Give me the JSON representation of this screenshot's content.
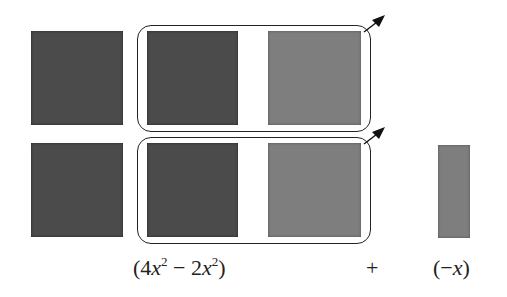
{
  "diagram": {
    "rows": [
      {
        "tiles": [
          "x2-dark",
          "x2-dark",
          "x2-light"
        ],
        "grouped": [
          "x2-dark",
          "x2-light"
        ]
      },
      {
        "tiles": [
          "x2-dark",
          "x2-dark",
          "x2-light",
          "x-light"
        ],
        "grouped": [
          "x2-dark",
          "x2-light"
        ]
      }
    ],
    "colors": {
      "dark_tile": "#4b4b4b",
      "light_tile": "#7e7e7e",
      "outline": "#222222"
    },
    "labels": {
      "term1_open": "(4",
      "term1_var1": "x",
      "term1_exp1": "2",
      "term1_mid": " − 2",
      "term1_var2": "x",
      "term1_exp2": "2",
      "term1_close": ")",
      "operator": "+",
      "term2_open": "(−",
      "term2_var": "x",
      "term2_close": ")"
    },
    "icons": [
      "arrow-up-right-icon",
      "arrow-up-right-icon"
    ]
  }
}
